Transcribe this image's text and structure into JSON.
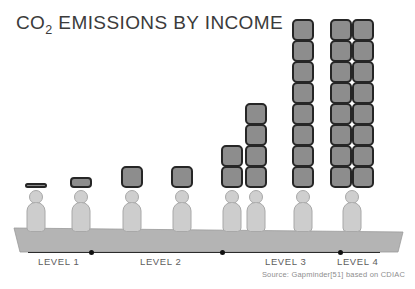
{
  "title": {
    "prefix": "CO",
    "sub": "2",
    "suffix": " EMISSIONS BY INCOME",
    "full": "CO2 EMISSIONS BY INCOME"
  },
  "source": "Source: Gapminder[51] based on CDIAC",
  "levels": [
    {
      "label": "LEVEL 1",
      "x": 38
    },
    {
      "label": "LEVEL 2",
      "x": 140
    },
    {
      "label": "LEVEL 3",
      "x": 265
    },
    {
      "label": "LEVEL 4",
      "x": 337
    }
  ],
  "ticks": [
    89,
    220,
    338
  ],
  "colors": {
    "block_fill": "#8d8d8d",
    "block_border": "#262626",
    "person_fill": "#cdcdcd",
    "person_border": "#a8a8a8",
    "ground": "#b4b4b4",
    "title_text": "#3b3b3b",
    "label_text": "#5d5d5d",
    "source_text": "#8e8e8e"
  },
  "chart_data": {
    "type": "bar",
    "title": "CO2 EMISSIONS BY INCOME",
    "xlabel": "",
    "ylabel": "",
    "unit": "blocks (pictogram units of CO2 emissions per person)",
    "categories": [
      "Level 1",
      "Level 1",
      "Level 2",
      "Level 2",
      "Level 3",
      "Level 3",
      "Level 4",
      "Level 4"
    ],
    "x": [
      1,
      2,
      3,
      4,
      5,
      6,
      7,
      8
    ],
    "values": [
      0.2,
      0.5,
      1,
      1,
      2,
      4,
      8,
      16
    ],
    "grid": false,
    "legend": false,
    "annotations": [
      "Source: Gapminder[51] based on CDIAC"
    ]
  },
  "columns": [
    {
      "name": "column-1",
      "x": 36,
      "blocks": 0,
      "partial": "a",
      "cols": 1,
      "rows": 0
    },
    {
      "name": "column-2",
      "x": 81,
      "blocks": 0,
      "partial": "b",
      "cols": 1,
      "rows": 0
    },
    {
      "name": "column-3",
      "x": 132,
      "blocks": 1,
      "partial": "",
      "cols": 1,
      "rows": 1
    },
    {
      "name": "column-4",
      "x": 182,
      "blocks": 1,
      "partial": "",
      "cols": 1,
      "rows": 1
    },
    {
      "name": "column-5",
      "x": 232,
      "blocks": 2,
      "partial": "",
      "cols": 1,
      "rows": 2
    },
    {
      "name": "column-6",
      "x": 256,
      "blocks": 4,
      "partial": "",
      "cols": 1,
      "rows": 4
    },
    {
      "name": "column-7",
      "x": 303,
      "blocks": 8,
      "partial": "",
      "cols": 1,
      "rows": 8
    },
    {
      "name": "column-8",
      "x": 352,
      "blocks": 16,
      "partial": "",
      "cols": 2,
      "rows": 8
    }
  ]
}
